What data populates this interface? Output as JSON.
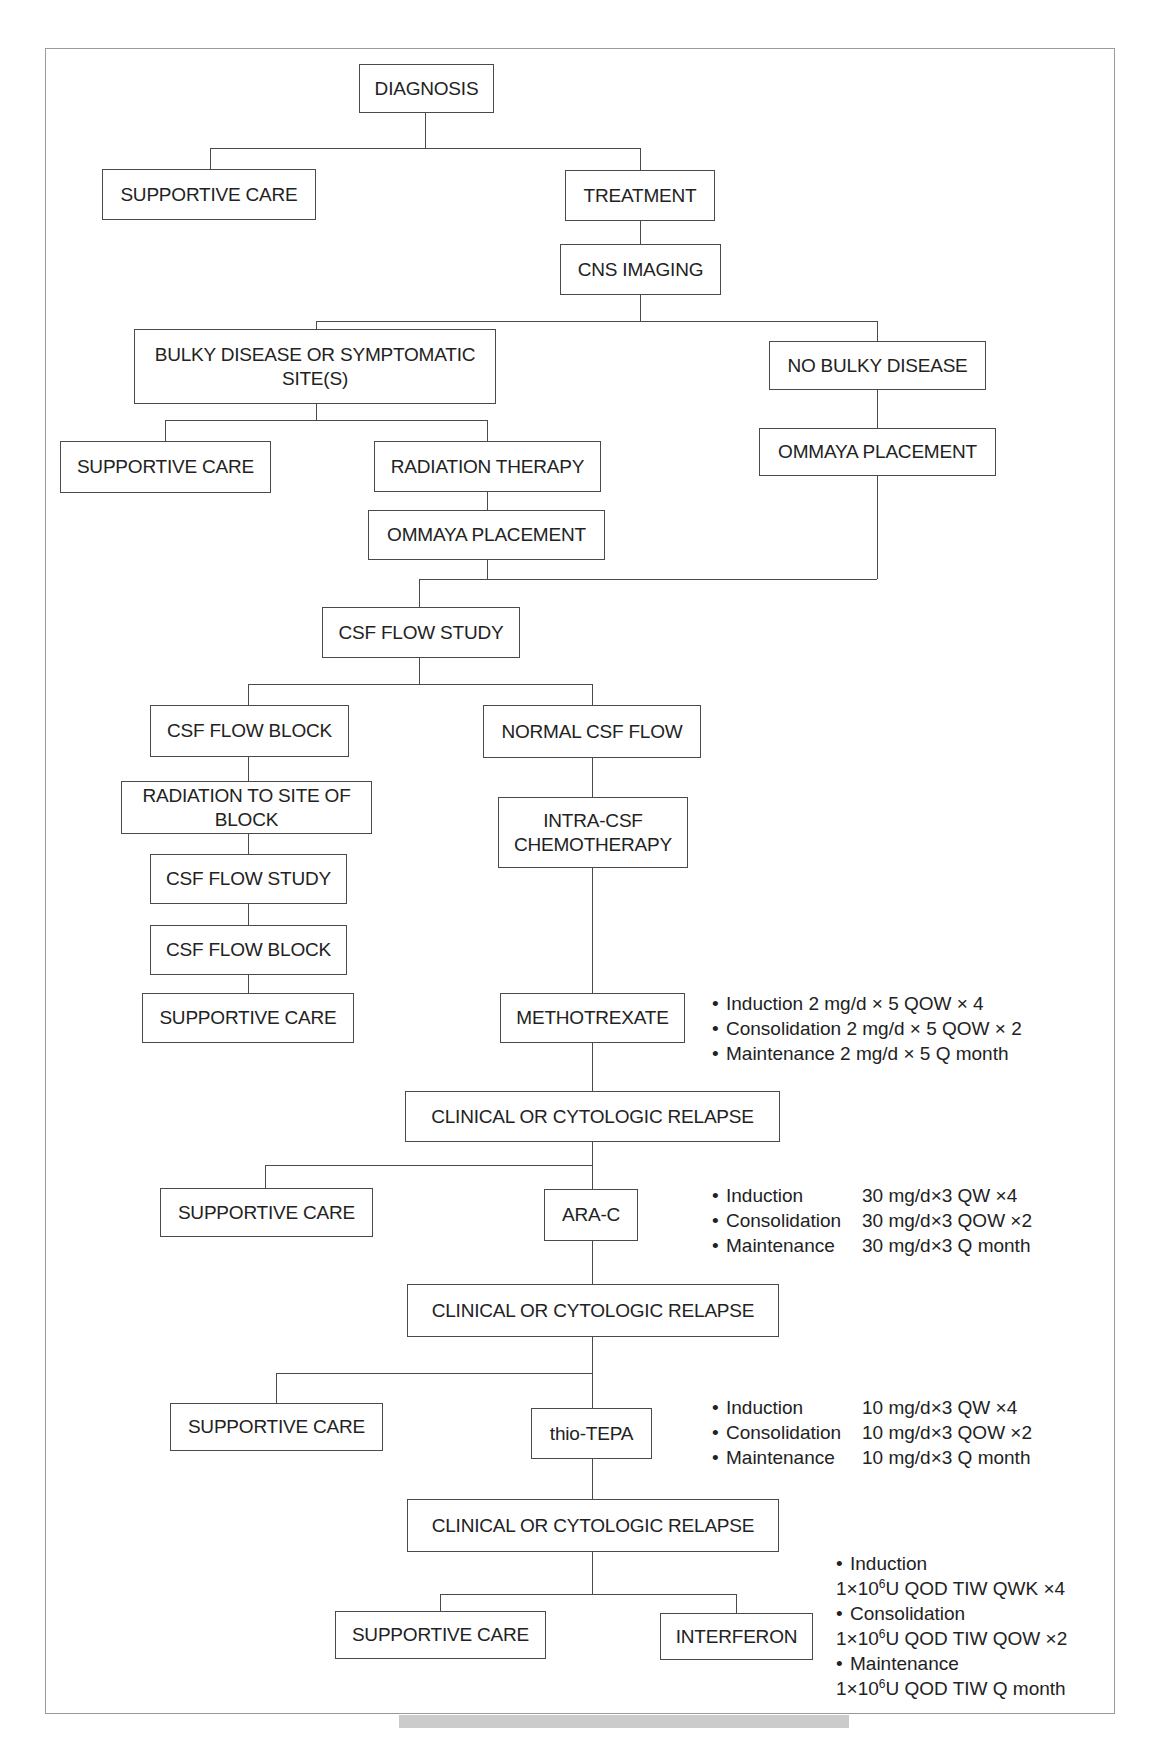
{
  "flowchart": {
    "nodes": [
      {
        "id": "diagnosis",
        "label": "DIAGNOSIS",
        "x": 359,
        "y": 64,
        "w": 135,
        "h": 49
      },
      {
        "id": "supportive-care-1",
        "label": "SUPPORTIVE CARE",
        "x": 102,
        "y": 169,
        "w": 214,
        "h": 51
      },
      {
        "id": "treatment",
        "label": "TREATMENT",
        "x": 565,
        "y": 170,
        "w": 150,
        "h": 51
      },
      {
        "id": "cns-imaging",
        "label": "CNS IMAGING",
        "x": 560,
        "y": 244,
        "w": 161,
        "h": 51
      },
      {
        "id": "bulky-disease",
        "label": "BULKY DISEASE OR SYMPTOMATIC SITE(S)",
        "x": 134,
        "y": 329,
        "w": 362,
        "h": 75
      },
      {
        "id": "no-bulky-disease",
        "label": "NO BULKY DISEASE",
        "x": 769,
        "y": 341,
        "w": 217,
        "h": 49
      },
      {
        "id": "supportive-care-2",
        "label": "SUPPORTIVE CARE",
        "x": 60,
        "y": 441,
        "w": 211,
        "h": 52
      },
      {
        "id": "radiation-therapy",
        "label": "RADIATION THERAPY",
        "x": 374,
        "y": 441,
        "w": 227,
        "h": 51
      },
      {
        "id": "ommaya-placement-right",
        "label": "OMMAYA PLACEMENT",
        "x": 759,
        "y": 428,
        "w": 237,
        "h": 48
      },
      {
        "id": "ommaya-placement-left",
        "label": "OMMAYA PLACEMENT",
        "x": 368,
        "y": 510,
        "w": 237,
        "h": 50
      },
      {
        "id": "csf-flow-study-1",
        "label": "CSF FLOW STUDY",
        "x": 322,
        "y": 607,
        "w": 198,
        "h": 51
      },
      {
        "id": "csf-flow-block-1",
        "label": "CSF FLOW BLOCK",
        "x": 150,
        "y": 705,
        "w": 199,
        "h": 52
      },
      {
        "id": "normal-csf-flow",
        "label": "NORMAL CSF FLOW",
        "x": 483,
        "y": 705,
        "w": 218,
        "h": 53
      },
      {
        "id": "radiation-to-site",
        "label": "RADIATION TO SITE OF BLOCK",
        "x": 121,
        "y": 781,
        "w": 251,
        "h": 53
      },
      {
        "id": "intra-csf-chemo",
        "label": "INTRA-CSF CHEMOTHERAPY",
        "x": 498,
        "y": 797,
        "w": 190,
        "h": 71
      },
      {
        "id": "csf-flow-study-2",
        "label": "CSF FLOW STUDY",
        "x": 150,
        "y": 854,
        "w": 197,
        "h": 50
      },
      {
        "id": "csf-flow-block-2",
        "label": "CSF FLOW BLOCK",
        "x": 150,
        "y": 925,
        "w": 197,
        "h": 50
      },
      {
        "id": "supportive-care-3",
        "label": "SUPPORTIVE CARE",
        "x": 142,
        "y": 993,
        "w": 212,
        "h": 50
      },
      {
        "id": "methotrexate",
        "label": "METHOTREXATE",
        "x": 500,
        "y": 993,
        "w": 185,
        "h": 50
      },
      {
        "id": "relapse-1",
        "label": "CLINICAL OR CYTOLOGIC RELAPSE",
        "x": 405,
        "y": 1091,
        "w": 375,
        "h": 51
      },
      {
        "id": "supportive-care-4",
        "label": "SUPPORTIVE CARE",
        "x": 160,
        "y": 1188,
        "w": 213,
        "h": 49
      },
      {
        "id": "ara-c",
        "label": "ARA-C",
        "x": 544,
        "y": 1189,
        "w": 94,
        "h": 52
      },
      {
        "id": "relapse-2",
        "label": "CLINICAL OR CYTOLOGIC RELAPSE",
        "x": 407,
        "y": 1284,
        "w": 372,
        "h": 53
      },
      {
        "id": "supportive-care-5",
        "label": "SUPPORTIVE CARE",
        "x": 170,
        "y": 1403,
        "w": 213,
        "h": 48
      },
      {
        "id": "thio-tepa",
        "label": "thio-TEPA",
        "x": 531,
        "y": 1408,
        "w": 121,
        "h": 51
      },
      {
        "id": "relapse-3",
        "label": "CLINICAL OR CYTOLOGIC RELAPSE",
        "x": 407,
        "y": 1499,
        "w": 372,
        "h": 53
      },
      {
        "id": "supportive-care-6",
        "label": "SUPPORTIVE CARE",
        "x": 335,
        "y": 1611,
        "w": 211,
        "h": 48
      },
      {
        "id": "interferon",
        "label": "INTERFERON",
        "x": 660,
        "y": 1613,
        "w": 153,
        "h": 47
      }
    ],
    "connectors": {
      "vertical": [
        {
          "x": 425,
          "y1": 113,
          "y2": 148
        },
        {
          "x": 210,
          "y1": 148,
          "y2": 169
        },
        {
          "x": 640,
          "y1": 148,
          "y2": 170
        },
        {
          "x": 640,
          "y1": 221,
          "y2": 244
        },
        {
          "x": 640,
          "y1": 295,
          "y2": 321
        },
        {
          "x": 316,
          "y1": 321,
          "y2": 329
        },
        {
          "x": 877,
          "y1": 321,
          "y2": 341
        },
        {
          "x": 316,
          "y1": 404,
          "y2": 420
        },
        {
          "x": 165,
          "y1": 420,
          "y2": 441
        },
        {
          "x": 487,
          "y1": 420,
          "y2": 441
        },
        {
          "x": 487,
          "y1": 492,
          "y2": 510
        },
        {
          "x": 487,
          "y1": 560,
          "y2": 579
        },
        {
          "x": 877,
          "y1": 390,
          "y2": 428
        },
        {
          "x": 877,
          "y1": 476,
          "y2": 579
        },
        {
          "x": 419,
          "y1": 579,
          "y2": 607
        },
        {
          "x": 419,
          "y1": 658,
          "y2": 684
        },
        {
          "x": 248,
          "y1": 684,
          "y2": 705
        },
        {
          "x": 592,
          "y1": 684,
          "y2": 705
        },
        {
          "x": 248,
          "y1": 757,
          "y2": 781
        },
        {
          "x": 248,
          "y1": 834,
          "y2": 854
        },
        {
          "x": 248,
          "y1": 904,
          "y2": 925
        },
        {
          "x": 248,
          "y1": 975,
          "y2": 993
        },
        {
          "x": 592,
          "y1": 758,
          "y2": 797
        },
        {
          "x": 592,
          "y1": 868,
          "y2": 993
        },
        {
          "x": 592,
          "y1": 1043,
          "y2": 1091
        },
        {
          "x": 592,
          "y1": 1142,
          "y2": 1189
        },
        {
          "x": 265,
          "y1": 1165,
          "y2": 1188
        },
        {
          "x": 592,
          "y1": 1241,
          "y2": 1284
        },
        {
          "x": 592,
          "y1": 1337,
          "y2": 1408
        },
        {
          "x": 276,
          "y1": 1373,
          "y2": 1403
        },
        {
          "x": 592,
          "y1": 1459,
          "y2": 1499
        },
        {
          "x": 592,
          "y1": 1552,
          "y2": 1594
        },
        {
          "x": 440,
          "y1": 1594,
          "y2": 1611
        },
        {
          "x": 736,
          "y1": 1594,
          "y2": 1613
        }
      ],
      "horizontal": [
        {
          "y": 148,
          "x1": 210,
          "x2": 640
        },
        {
          "y": 321,
          "x1": 316,
          "x2": 877
        },
        {
          "y": 420,
          "x1": 165,
          "x2": 487
        },
        {
          "y": 579,
          "x1": 419,
          "x2": 877
        },
        {
          "y": 684,
          "x1": 248,
          "x2": 592
        },
        {
          "y": 1165,
          "x1": 265,
          "x2": 592
        },
        {
          "y": 1373,
          "x1": 276,
          "x2": 592
        },
        {
          "y": 1594,
          "x1": 440,
          "x2": 736
        }
      ]
    },
    "notes": [
      {
        "id": "methotrexate-dosing",
        "x": 712,
        "y": 991,
        "columns": false,
        "rows": [
          {
            "bullet": "•",
            "label": "Induction 2 mg/d × 5 QOW × 4",
            "value": ""
          },
          {
            "bullet": "•",
            "label": "Consolidation 2 mg/d × 5 QOW × 2",
            "value": ""
          },
          {
            "bullet": "•",
            "label": "Maintenance 2 mg/d × 5 Q month",
            "value": ""
          }
        ]
      },
      {
        "id": "ara-c-dosing",
        "x": 712,
        "y": 1183,
        "columns": true,
        "rows": [
          {
            "bullet": "•",
            "label": "Induction",
            "value": "30 mg/d×3 QW ×4"
          },
          {
            "bullet": "•",
            "label": "Consolidation",
            "value": "30 mg/d×3 QOW ×2"
          },
          {
            "bullet": "•",
            "label": "Maintenance",
            "value": "30 mg/d×3 Q month"
          }
        ]
      },
      {
        "id": "thio-tepa-dosing",
        "x": 712,
        "y": 1395,
        "columns": true,
        "rows": [
          {
            "bullet": "•",
            "label": "Induction",
            "value": "10 mg/d×3 QW ×4"
          },
          {
            "bullet": "•",
            "label": "Consolidation",
            "value": "10 mg/d×3 QOW ×2"
          },
          {
            "bullet": "•",
            "label": "Maintenance",
            "value": "10 mg/d×3 Q month"
          }
        ]
      },
      {
        "id": "interferon-dosing",
        "x": 836,
        "y": 1551,
        "columns": false,
        "rows": [
          {
            "bullet": "•",
            "label": "Induction",
            "value": ""
          },
          {
            "bullet": "",
            "label": "1×10",
            "sup": "6",
            "label_after": "U QOD TIW QWK ×4",
            "value": ""
          },
          {
            "bullet": "•",
            "label": "Consolidation",
            "value": ""
          },
          {
            "bullet": "",
            "label": "1×10",
            "sup": "6",
            "label_after": "U QOD TIW QOW ×2",
            "value": ""
          },
          {
            "bullet": "•",
            "label": "Maintenance",
            "value": ""
          },
          {
            "bullet": "",
            "label": "1×10",
            "sup": "6",
            "label_after": "U QOD TIW Q month",
            "value": ""
          }
        ]
      }
    ]
  },
  "colors": {
    "frame": "#9a9a9a",
    "box_border": "#4a4a4a",
    "text": "#222222",
    "footer_bar": "#cbcbcb"
  }
}
